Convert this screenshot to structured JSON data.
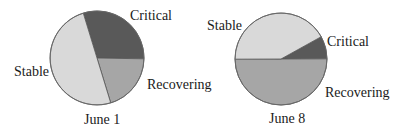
{
  "chart_data": [
    {
      "type": "pie",
      "title": "June 1",
      "categories": [
        "Critical",
        "Recovering",
        "Stable"
      ],
      "values": [
        30,
        20,
        50
      ],
      "colors": [
        "#595959",
        "#a6a6a6",
        "#d9d9d9"
      ],
      "start_angle_deg": 107,
      "direction": "clockwise",
      "legend": "none (direct labels)"
    },
    {
      "type": "pie",
      "title": "June 8",
      "categories": [
        "Critical",
        "Recovering",
        "Stable"
      ],
      "values": [
        8,
        50,
        42
      ],
      "colors": [
        "#595959",
        "#a6a6a6",
        "#d9d9d9"
      ],
      "start_angle_deg": 29,
      "direction": "clockwise",
      "legend": "none (direct labels)"
    }
  ],
  "pies": [
    {
      "caption": "June 1",
      "labels": {
        "critical": "Critical",
        "recovering": "Recovering",
        "stable": "Stable"
      }
    },
    {
      "caption": "June 8",
      "labels": {
        "critical": "Critical",
        "recovering": "Recovering",
        "stable": "Stable"
      }
    }
  ]
}
